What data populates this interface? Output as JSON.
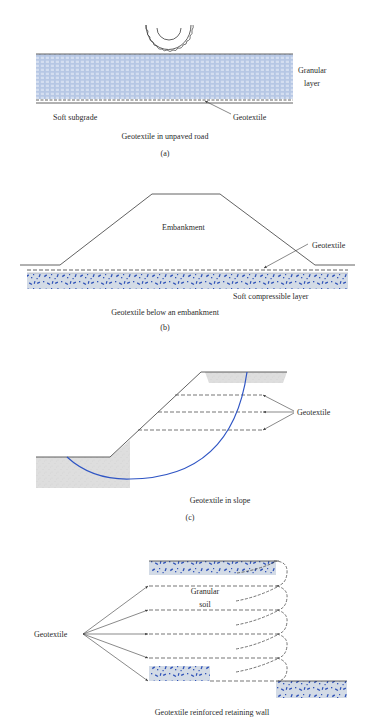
{
  "colors": {
    "line": "#3a3a3a",
    "granular_fill": "#a9bde0",
    "granular_cell": "#d4def0",
    "gravel_bg": "#d3dbe6",
    "gravel_chip": "#2f52b8",
    "sand_fill": "#dedede",
    "slip_surface": "#2f55c4"
  },
  "panel_a": {
    "labels": {
      "granular_layer_line1": "Granular",
      "granular_layer_line2": "layer",
      "soft_subgrade": "Soft subgrade",
      "geotextile": "Geotextile"
    },
    "caption": "Geotextile in unpaved road",
    "letter": "(a)"
  },
  "panel_b": {
    "labels": {
      "embankment": "Embankment",
      "geotextile": "Geotextile",
      "soft_compressible_layer": "Soft compressible layer"
    },
    "caption": "Geotextile below an embankment",
    "letter": "(b)"
  },
  "panel_c": {
    "labels": {
      "geotextile": "Geotextile"
    },
    "caption": "Geotextile in slope",
    "letter": "(c)"
  },
  "panel_d": {
    "labels": {
      "geotextile": "Geotextile",
      "granular_soil_line1": "Granular",
      "granular_soil_line2": "soil"
    },
    "caption": "Geotextile reinforced retaining wall"
  }
}
